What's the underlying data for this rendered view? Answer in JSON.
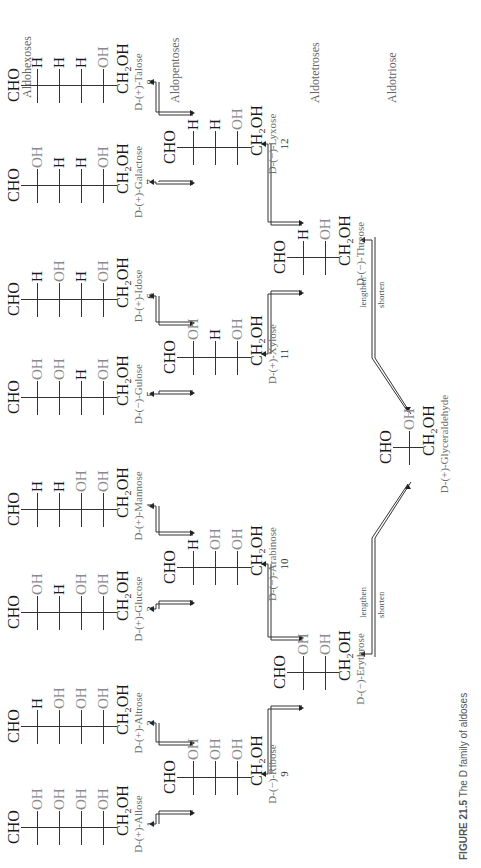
{
  "figure": {
    "caption_label": "FIGURE 21.5",
    "caption_text": "The D family of aldoses",
    "row_labels": {
      "hexoses": "Aldohexoses",
      "pentoses": "Aldopentoses",
      "tetroses": "Aldotetroses",
      "triose": "Aldotriose"
    },
    "ladder_labels": {
      "lengthen": "lengthen",
      "shorten": "shorten"
    },
    "groups": {
      "top": "CHO",
      "bottom": "CH₂OH"
    },
    "aldohexoses": [
      {
        "number": "1",
        "name": "D-(+)-Allose",
        "left": [
          "H",
          "H",
          "H",
          "H"
        ],
        "right": [
          "OH",
          "OH",
          "OH",
          "OH"
        ]
      },
      {
        "number": "2",
        "name": "D-(+)-Altrose",
        "left": [
          "HO",
          "H",
          "H",
          "H"
        ],
        "right": [
          "H",
          "OH",
          "OH",
          "OH"
        ]
      },
      {
        "number": "3",
        "name": "D-(+)-Glucose",
        "left": [
          "H",
          "HO",
          "H",
          "H"
        ],
        "right": [
          "OH",
          "H",
          "OH",
          "OH"
        ]
      },
      {
        "number": "4",
        "name": "D-(+)-Mannose",
        "left": [
          "HO",
          "HO",
          "H",
          "H"
        ],
        "right": [
          "H",
          "H",
          "OH",
          "OH"
        ]
      },
      {
        "number": "5",
        "name": "D-(−)-Gulose",
        "left": [
          "H",
          "H",
          "HO",
          "H"
        ],
        "right": [
          "OH",
          "OH",
          "H",
          "OH"
        ]
      },
      {
        "number": "6",
        "name": "D-(+)-Idose",
        "left": [
          "HO",
          "H",
          "HO",
          "H"
        ],
        "right": [
          "H",
          "OH",
          "H",
          "OH"
        ]
      },
      {
        "number": "7",
        "name": "D-(+)-Galactose",
        "left": [
          "H",
          "HO",
          "HO",
          "H"
        ],
        "right": [
          "OH",
          "H",
          "H",
          "OH"
        ]
      },
      {
        "number": "8",
        "name": "D-(+)-Talose",
        "left": [
          "HO",
          "HO",
          "HO",
          "H"
        ],
        "right": [
          "H",
          "H",
          "H",
          "OH"
        ]
      }
    ],
    "aldopentoses": [
      {
        "number": "9",
        "name": "D-(−)-Ribose",
        "left": [
          "H",
          "H",
          "H"
        ],
        "right": [
          "OH",
          "OH",
          "OH"
        ]
      },
      {
        "number": "10",
        "name": "D-(−)-Arabinose",
        "left": [
          "HO",
          "H",
          "H"
        ],
        "right": [
          "H",
          "OH",
          "OH"
        ]
      },
      {
        "number": "11",
        "name": "D-(+)-Xylose",
        "left": [
          "H",
          "HO",
          "H"
        ],
        "right": [
          "OH",
          "H",
          "OH"
        ]
      },
      {
        "number": "12",
        "name": "D-(−)-Lyxose",
        "left": [
          "HO",
          "HO",
          "H"
        ],
        "right": [
          "H",
          "H",
          "OH"
        ]
      }
    ],
    "aldotetroses": [
      {
        "name": "D-(−)-Erythrose",
        "left": [
          "H",
          "H"
        ],
        "right": [
          "OH",
          "OH"
        ]
      },
      {
        "name": "D-(−)-Threose",
        "left": [
          "HO",
          "H"
        ],
        "right": [
          "H",
          "OH"
        ]
      }
    ],
    "aldotriose": [
      {
        "name": "D-(+)-Glyceraldehyde",
        "left": [
          "H"
        ],
        "right": [
          "OH"
        ]
      }
    ]
  }
}
